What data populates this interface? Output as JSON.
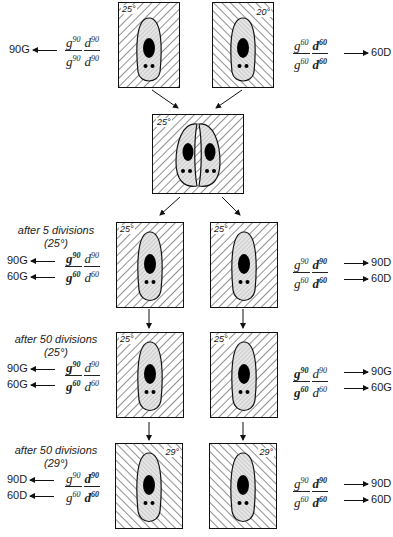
{
  "figure": {
    "colors": {
      "ink": "#111111",
      "hatch": "#222222",
      "cell_fill": "#e6e6e6",
      "nucleus": "#000000"
    },
    "rows": [
      {
        "id": "parents",
        "caption": null,
        "left": {
          "temp": "25°",
          "hatch": "backslash",
          "formula": {
            "num": [
              "g",
              "90",
              "d",
              "90"
            ],
            "den": [
              "g",
              "90",
              "d",
              "90"
            ]
          },
          "outputs": [
            {
              "label": "90G",
              "direction": "left"
            }
          ]
        },
        "right": {
          "temp": "20°",
          "hatch": "slash",
          "formula": {
            "num": [
              "g",
              "60",
              "d",
              "60"
            ],
            "den": [
              "g",
              "60",
              "d",
              "60"
            ]
          },
          "outputs": [
            {
              "label": "60D",
              "direction": "right"
            }
          ]
        }
      },
      {
        "id": "conjugation",
        "temp": "25°",
        "hatch": "backslash"
      },
      {
        "id": "after-5",
        "caption": {
          "line1": "after 5 divisions",
          "line2": "(25°)"
        },
        "left": {
          "temp": "25°",
          "hatch": "backslash",
          "formula": {
            "num": [
              "g",
              "90",
              "d",
              "90"
            ],
            "den": [
              "g",
              "60",
              "d",
              "60"
            ]
          },
          "outputs": [
            {
              "label": "90G",
              "direction": "left"
            },
            {
              "label": "60G",
              "direction": "left"
            }
          ]
        },
        "right": {
          "temp": "25°",
          "hatch": "backslash",
          "formula": {
            "num": [
              "g",
              "90",
              "d",
              "90"
            ],
            "den": [
              "g",
              "60",
              "d",
              "60"
            ]
          },
          "outputs": [
            {
              "label": "90D",
              "direction": "right"
            },
            {
              "label": "60D",
              "direction": "right"
            }
          ]
        }
      },
      {
        "id": "after-50-25",
        "caption": {
          "line1": "after 50 divisions",
          "line2": "(25°)"
        },
        "left": {
          "temp": "25°",
          "hatch": "backslash",
          "formula": {
            "num": [
              "g",
              "90",
              "d",
              "90"
            ],
            "den": [
              "g",
              "60",
              "d",
              "60"
            ]
          },
          "outputs": [
            {
              "label": "90G",
              "direction": "left"
            },
            {
              "label": "60G",
              "direction": "left"
            }
          ]
        },
        "right": {
          "temp": "25°",
          "hatch": "backslash",
          "formula": {
            "num": [
              "g",
              "90",
              "d",
              "90"
            ],
            "den": [
              "g",
              "60",
              "d",
              "60"
            ]
          },
          "outputs": [
            {
              "label": "90G",
              "direction": "right"
            },
            {
              "label": "60G",
              "direction": "right"
            }
          ]
        }
      },
      {
        "id": "after-50-29",
        "caption": {
          "line1": "after 50 divisions",
          "line2": "(29°)"
        },
        "left": {
          "temp": "29°",
          "hatch": "slash",
          "formula": {
            "num": [
              "g",
              "90",
              "d",
              "90"
            ],
            "den": [
              "g",
              "60",
              "d",
              "60"
            ]
          },
          "outputs": [
            {
              "label": "90D",
              "direction": "left"
            },
            {
              "label": "60D",
              "direction": "left"
            }
          ]
        },
        "right": {
          "temp": "29°",
          "hatch": "slash",
          "formula": {
            "num": [
              "g",
              "90",
              "d",
              "90"
            ],
            "den": [
              "g",
              "60",
              "d",
              "60"
            ]
          },
          "outputs": [
            {
              "label": "90D",
              "direction": "right"
            },
            {
              "label": "60D",
              "direction": "right"
            }
          ]
        }
      }
    ]
  }
}
